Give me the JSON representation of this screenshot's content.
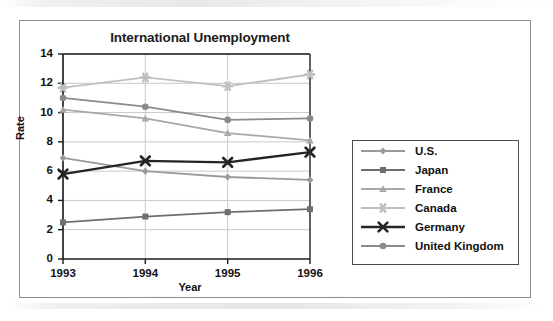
{
  "chart_data": {
    "type": "line",
    "title": "International Unemployment",
    "xlabel": "Year",
    "ylabel": "Rate",
    "categories": [
      "1993",
      "1994",
      "1995",
      "1996"
    ],
    "x": [
      1993,
      1994,
      1995,
      1996
    ],
    "ylim": [
      0,
      14
    ],
    "yticks": [
      "0",
      "2",
      "4",
      "6",
      "8",
      "10",
      "12",
      "14"
    ],
    "grid": "horizontal-and-vertical",
    "legend_position": "right",
    "series": [
      {
        "name": "U.S.",
        "values": [
          6.9,
          6.0,
          5.6,
          5.4
        ],
        "color": "#9a9a9a",
        "marker": "diamond"
      },
      {
        "name": "Japan",
        "values": [
          2.5,
          2.9,
          3.2,
          3.4
        ],
        "color": "#6e6e6e",
        "marker": "square"
      },
      {
        "name": "France",
        "values": [
          10.2,
          9.6,
          8.6,
          8.1
        ],
        "color": "#a8a8a8",
        "marker": "triangle"
      },
      {
        "name": "Canada",
        "values": [
          11.7,
          12.4,
          11.8,
          12.6
        ],
        "color": "#bfbfbf",
        "marker": "star"
      },
      {
        "name": "Germany",
        "values": [
          5.8,
          6.7,
          6.6,
          7.3
        ],
        "color": "#242424",
        "marker": "x"
      },
      {
        "name": "United Kingdom",
        "values": [
          11.0,
          10.4,
          9.5,
          9.6
        ],
        "color": "#8a8a8a",
        "marker": "circle"
      }
    ]
  },
  "legend": {
    "items": [
      {
        "label": "U.S."
      },
      {
        "label": "Japan"
      },
      {
        "label": "France"
      },
      {
        "label": "Canada"
      },
      {
        "label": "Germany"
      },
      {
        "label": "United Kingdom"
      }
    ]
  },
  "colors": {
    "frame_border": "#8d8d8d",
    "axis": "#1b1b1b",
    "grid": "#c9c9c9",
    "legend_border": "#4b4b4b",
    "text": "#111111",
    "background": "#ffffff"
  }
}
